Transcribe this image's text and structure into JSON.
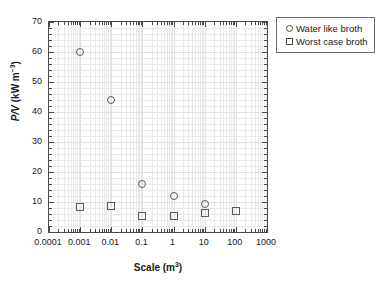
{
  "chart_data": {
    "type": "scatter",
    "title": "",
    "xlabel": "Scale (m3)",
    "xlabel_base": "Scale (m",
    "xlabel_sup": "3",
    "xlabel_close": ")",
    "ylabel_prefix": "P/V",
    "ylabel_unit_base": " (kW m",
    "ylabel_unit_sup": "-3",
    "ylabel_unit_close": ")",
    "xscale": "log",
    "yscale": "linear",
    "xlim": [
      0.0001,
      1000
    ],
    "ylim": [
      0,
      70
    ],
    "grid": true,
    "grid_minor": true,
    "legend_position": "outside-right-top",
    "xticklabels": [
      "0.0001",
      "0.001",
      "0.01",
      "0.1",
      "1",
      "10",
      "100",
      "1000"
    ],
    "xtickvalues": [
      0.0001,
      0.001,
      0.01,
      0.1,
      1,
      10,
      100,
      1000
    ],
    "yticklabels": [
      "0",
      "10",
      "20",
      "30",
      "40",
      "50",
      "60",
      "70"
    ],
    "ytickvalues": [
      0,
      10,
      20,
      30,
      40,
      50,
      60,
      70
    ],
    "series": [
      {
        "name": "Water like broth",
        "marker": "circle",
        "x": [
          0.001,
          0.01,
          0.1,
          1,
          10
        ],
        "y": [
          60,
          44,
          16,
          12,
          9.5
        ]
      },
      {
        "name": "Worst case broth",
        "marker": "square",
        "x": [
          0.001,
          0.01,
          0.1,
          1,
          10,
          100
        ],
        "y": [
          8.5,
          8.6,
          5.3,
          5.5,
          6.5,
          7
        ]
      }
    ]
  },
  "legend": {
    "entries": [
      {
        "label": "Water like broth",
        "marker": "circle"
      },
      {
        "label": "Worst case broth",
        "marker": "square"
      }
    ]
  }
}
